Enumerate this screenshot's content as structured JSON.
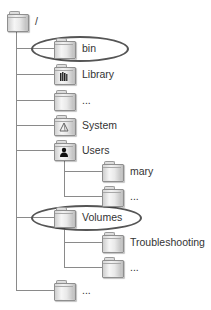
{
  "diagram": {
    "root": {
      "label": "/",
      "icon": "folder-icon"
    },
    "level1": [
      {
        "label": "bin",
        "icon": "folder-icon",
        "highlighted": true
      },
      {
        "label": "Library",
        "icon": "library-folder-icon",
        "highlighted": false
      },
      {
        "label": "...",
        "icon": "folder-icon",
        "highlighted": false
      },
      {
        "label": "System",
        "icon": "system-folder-icon",
        "highlighted": false
      },
      {
        "label": "Users",
        "icon": "users-folder-icon",
        "highlighted": false,
        "children": [
          {
            "label": "mary",
            "icon": "folder-icon"
          },
          {
            "label": "...",
            "icon": "folder-icon"
          }
        ]
      },
      {
        "label": "Volumes",
        "icon": "folder-icon",
        "highlighted": true,
        "children": [
          {
            "label": "Troubleshooting",
            "icon": "folder-icon"
          },
          {
            "label": "...",
            "icon": "folder-icon"
          }
        ]
      },
      {
        "label": "...",
        "icon": "folder-icon",
        "highlighted": false
      }
    ],
    "colors": {
      "line": "#8a8a8a",
      "highlight_ellipse": "#555555",
      "text": "#333333"
    }
  }
}
